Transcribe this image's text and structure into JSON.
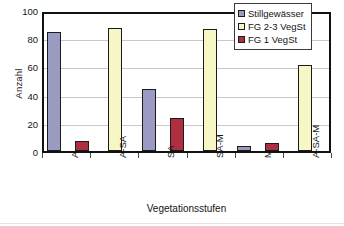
{
  "chart_data": {
    "type": "bar",
    "title": "",
    "xlabel": "Vegetationsstufen",
    "ylabel": "Anzahl",
    "categories": [
      "A",
      "A-SA",
      "SA",
      "SA-M",
      "M",
      "A-SA-M"
    ],
    "series": [
      {
        "name": "Stillgewässer",
        "color": "#9b9bc2",
        "values": [
          87,
          0,
          45,
          0,
          4,
          0
        ]
      },
      {
        "name": "FG 2-3 VegSt",
        "color": "#f7f7c6",
        "values": [
          0,
          90,
          0,
          89,
          0,
          63
        ]
      },
      {
        "name": "FG 1 VegSt",
        "color": "#ae2f40",
        "values": [
          7,
          0,
          24,
          0,
          6,
          0
        ]
      }
    ],
    "ylim": [
      0,
      100
    ],
    "yticks": [
      0,
      20,
      40,
      60,
      80,
      100
    ],
    "ytick_labels": [
      "0",
      "20",
      "40",
      "60",
      "80",
      "100"
    ],
    "grid": "horizontal",
    "legend_position": "top-right"
  },
  "legend": {
    "items": [
      {
        "label": "Stillgewässer"
      },
      {
        "label": "FG 2-3 VegSt"
      },
      {
        "label": "FG 1 VegSt"
      }
    ]
  }
}
